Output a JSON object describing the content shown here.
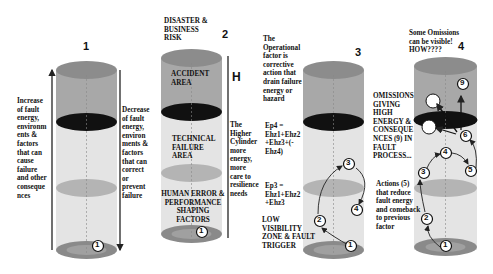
{
  "colors": {
    "top_band": "#a8a8a8",
    "top_cap": "#8c8c8c",
    "lower_band": "#e2e2e2",
    "dark_ellipse": "#111111",
    "mid_ellipse": "#b4b4b4",
    "base_ellipse": "#8a8a8a"
  },
  "cylinders": [
    {
      "number": "1",
      "left_text": "Increase\nof fault\nenergy,\nenvironm\nents &\nfactors\nthat can\ncause\nfailure\nand other\nconseque\nnces",
      "right_text": "Decrease\nof fault\nenergy,\nenviron\nments &\nfactors\nthat can\ncorrect\nor\nprevent\nfailure",
      "markers": [
        "1"
      ]
    },
    {
      "number": "2",
      "title": "DISASTER &\nBUSINESS\nRISK",
      "zone_top": "ACCIDENT\nAREA",
      "zone_mid": "TECHNICAL\nFAILURE\nAREA",
      "zone_bottom": "HUMAN ERROR &\nPERFORMANCE\nSHAPING\nFACTORS",
      "height_label": "H",
      "right_text": "The\nHigher\nCylinder\nmore\nenergy,\nmore\ncare to\nresilience\nneeds",
      "markers": [
        "1"
      ]
    },
    {
      "number": "3",
      "left_text_top": "The\nOperational\nfactor is\ncorrective\naction that\ndrain failure\nenergy or\nhazard",
      "equation_ep4": "Ep4 =\nEhz1+Ehz2\n+Ehz3+(-\nEhz4)",
      "equation_ep3": "Ep3 =\nEhz1+Ehz2\n+Ehz3",
      "bottom_label": "LOW\nVISIBILITY\nZONE & FAULT\nTRIGGER",
      "markers": [
        "1",
        "2",
        "3",
        "4"
      ]
    },
    {
      "number": "4",
      "title": "Some Omissions\ncan be visible!\nHOW????",
      "left_text_top": "OMISSIONS\nGIVING\nHIGH\nENERGY &\nCONSEQUE\nNCES (9) IN\nFAULT\nPROCESS...",
      "left_text_bottom": "Actions (5)\nthat reduce\nfault energy\nand comeback\nto previous\nfactor",
      "markers": [
        "1",
        "2",
        "3",
        "4",
        "5",
        "6",
        "9"
      ]
    }
  ]
}
